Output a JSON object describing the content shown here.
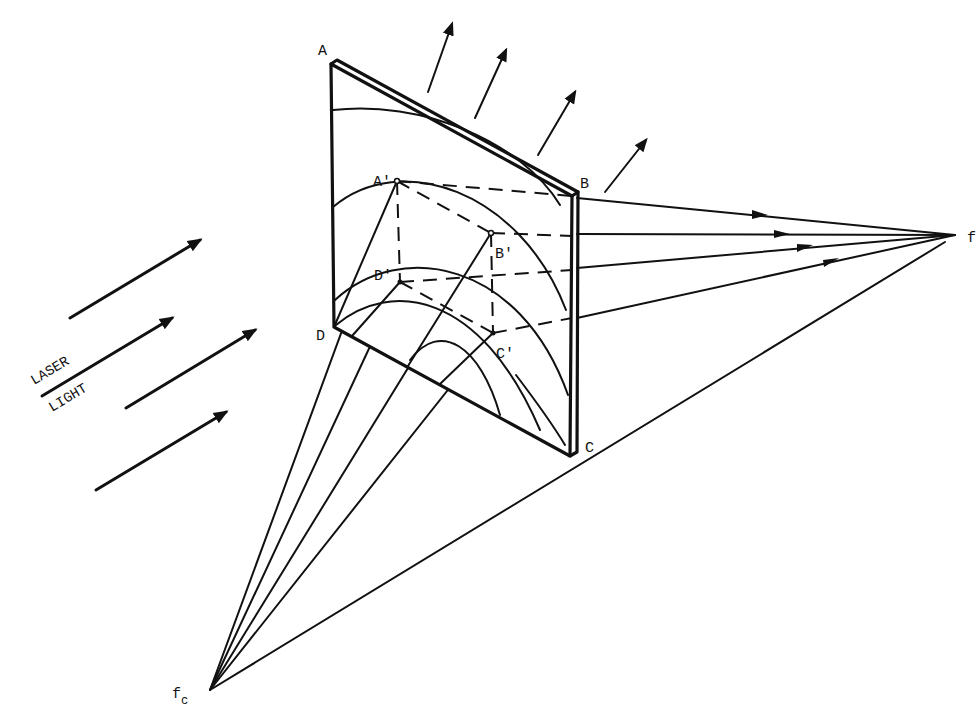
{
  "figure": {
    "type": "hologram reconstruction geometry",
    "colors": {
      "ink": "#111111",
      "background": "#ffffff"
    }
  },
  "labels": {
    "corner_a": "A",
    "corner_b": "B",
    "corner_c": "C",
    "corner_d": "D",
    "point_a_prime": "A'",
    "point_b_prime": "B'",
    "point_c_prime": "C'",
    "point_d_prime": "D'",
    "focus_right": "f",
    "focus_bottom": "f",
    "focus_bottom_sub": "c",
    "laser_word_1": "LASER",
    "laser_word_2": "LIGHT"
  },
  "geometry": {
    "plate": {
      "A": [
        331,
        64
      ],
      "B": [
        572,
        196
      ],
      "C": [
        570,
        456
      ],
      "D": [
        334,
        327
      ]
    },
    "inner_points": {
      "A'": [
        397,
        181
      ],
      "B'": [
        491,
        233
      ],
      "C'": [
        493,
        333
      ],
      "D'": [
        400,
        282
      ]
    },
    "focus_f": [
      955,
      235
    ],
    "focus_fc": [
      210,
      690
    ],
    "incident_arrows": 4,
    "outgoing_arrows_top": 4,
    "rays_to_f": 4,
    "rays_to_fc": 5
  }
}
